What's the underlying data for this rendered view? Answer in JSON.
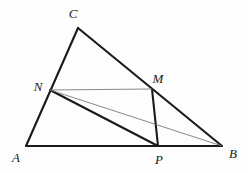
{
  "figure": {
    "width": 248,
    "height": 173,
    "background_color": "#fdfdfd",
    "stroke_color_thick": "#1a1a1a",
    "stroke_color_thin": "#6b6b6b",
    "label_color": "#1a1a1a",
    "thick_width": 2.1,
    "thin_width": 0.8
  },
  "points": {
    "A": {
      "label": "A",
      "x": 26,
      "y": 146,
      "label_x": 16,
      "label_y": 157
    },
    "B": {
      "label": "B",
      "x": 222,
      "y": 146,
      "label_x": 233,
      "label_y": 153
    },
    "C": {
      "label": "C",
      "x": 78,
      "y": 28,
      "label_x": 73,
      "label_y": 13
    },
    "M": {
      "label": "M",
      "x": 152,
      "y": 89,
      "label_x": 158,
      "label_y": 78
    },
    "N": {
      "label": "N",
      "x": 50,
      "y": 90,
      "label_x": 38,
      "label_y": 86
    },
    "P": {
      "label": "P",
      "x": 158,
      "y": 146,
      "label_x": 159,
      "label_y": 159
    }
  },
  "segments": [
    {
      "name": "side-AC",
      "from": "A",
      "to": "C",
      "weight": "thick"
    },
    {
      "name": "side-CB",
      "from": "C",
      "to": "B",
      "weight": "thick"
    },
    {
      "name": "side-AB",
      "from": "A",
      "to": "B",
      "weight": "thick"
    },
    {
      "name": "cevian-NP",
      "from": "N",
      "to": "P",
      "weight": "thick"
    },
    {
      "name": "cevian-MP",
      "from": "M",
      "to": "P",
      "weight": "thick"
    },
    {
      "name": "midline-NM",
      "from": "N",
      "to": "M",
      "weight": "thin"
    },
    {
      "name": "cevian-NB",
      "from": "N",
      "to": "B",
      "weight": "thin"
    }
  ]
}
